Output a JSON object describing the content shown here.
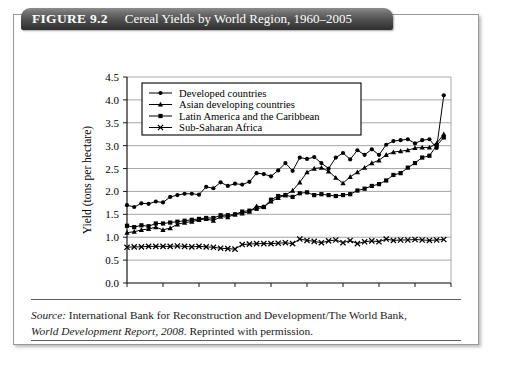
{
  "figure": {
    "label": "FIGURE 9.2",
    "title": "Cereal Yields by World Region, 1960–2005"
  },
  "source": {
    "lead": "Source:",
    "text_line1": " International Bank for Reconstruction and Development/The World Bank,",
    "italic_line2": "World Development Report, 2008",
    "text_line2_tail": ". Reprinted with permission."
  },
  "chart_data": {
    "type": "line",
    "title": "Cereal Yields by World Region, 1960–2005",
    "xlabel": "Year",
    "ylabel": "Yield (tons per hectare)",
    "xlim": [
      1960,
      2005
    ],
    "ylim": [
      0.0,
      4.5
    ],
    "ytick_step": 0.5,
    "xtick_step": 5,
    "grid": true,
    "legend_position": "top-left-inside",
    "xticks": [
      1960,
      1965,
      1970,
      1975,
      1980,
      1985,
      1990,
      1995,
      2000,
      2005
    ],
    "yticks": [
      "0.0",
      "0.5",
      "1.0",
      "1.5",
      "2.0",
      "2.5",
      "3.0",
      "3.5",
      "4.0",
      "4.5"
    ],
    "x": [
      1960,
      1961,
      1962,
      1963,
      1964,
      1965,
      1966,
      1967,
      1968,
      1969,
      1970,
      1971,
      1972,
      1973,
      1974,
      1975,
      1976,
      1977,
      1978,
      1979,
      1980,
      1981,
      1982,
      1983,
      1984,
      1985,
      1986,
      1987,
      1988,
      1989,
      1990,
      1991,
      1992,
      1993,
      1994,
      1995,
      1996,
      1997,
      1998,
      1999,
      2000,
      2001,
      2002,
      2003,
      2004
    ],
    "series": [
      {
        "name": "Developed countries",
        "marker": "circle",
        "color": "#000000",
        "values": [
          1.7,
          1.66,
          1.74,
          1.73,
          1.78,
          1.76,
          1.88,
          1.92,
          1.95,
          1.95,
          1.93,
          2.1,
          2.07,
          2.2,
          2.12,
          2.17,
          2.15,
          2.21,
          2.4,
          2.38,
          2.33,
          2.46,
          2.62,
          2.45,
          2.74,
          2.71,
          2.75,
          2.62,
          2.5,
          2.74,
          2.84,
          2.7,
          2.9,
          2.8,
          2.92,
          2.8,
          3.02,
          3.1,
          3.12,
          3.14,
          3.05,
          3.12,
          3.14,
          2.95,
          4.1
        ]
      },
      {
        "name": "Asian developing countries",
        "marker": "triangle",
        "color": "#000000",
        "values": [
          1.1,
          1.12,
          1.16,
          1.18,
          1.22,
          1.16,
          1.2,
          1.28,
          1.32,
          1.34,
          1.38,
          1.4,
          1.36,
          1.45,
          1.44,
          1.5,
          1.52,
          1.56,
          1.68,
          1.66,
          1.78,
          1.86,
          1.92,
          2.02,
          2.2,
          2.42,
          2.5,
          2.52,
          2.44,
          2.3,
          2.18,
          2.32,
          2.42,
          2.52,
          2.62,
          2.68,
          2.8,
          2.86,
          2.88,
          2.9,
          2.95,
          2.96,
          2.96,
          3.05,
          3.25
        ]
      },
      {
        "name": "Latin America and the Caribbean",
        "marker": "square",
        "color": "#000000",
        "values": [
          1.25,
          1.22,
          1.26,
          1.24,
          1.3,
          1.3,
          1.32,
          1.34,
          1.36,
          1.38,
          1.4,
          1.42,
          1.42,
          1.48,
          1.48,
          1.5,
          1.56,
          1.58,
          1.62,
          1.66,
          1.82,
          1.9,
          1.92,
          1.88,
          1.96,
          1.98,
          1.92,
          1.94,
          1.92,
          1.9,
          1.92,
          1.94,
          2.02,
          2.06,
          2.12,
          2.16,
          2.24,
          2.36,
          2.4,
          2.52,
          2.62,
          2.74,
          2.78,
          3.0,
          3.18
        ]
      },
      {
        "name": "Sub-Saharan Africa",
        "marker": "cross",
        "color": "#000000",
        "values": [
          0.78,
          0.79,
          0.79,
          0.8,
          0.8,
          0.8,
          0.8,
          0.81,
          0.8,
          0.79,
          0.8,
          0.79,
          0.78,
          0.76,
          0.75,
          0.74,
          0.84,
          0.85,
          0.86,
          0.86,
          0.86,
          0.87,
          0.88,
          0.86,
          0.96,
          0.93,
          0.91,
          0.88,
          0.92,
          0.94,
          0.88,
          0.93,
          0.86,
          0.9,
          0.92,
          0.9,
          0.96,
          0.93,
          0.94,
          0.94,
          0.95,
          0.94,
          0.93,
          0.94,
          0.95
        ]
      }
    ]
  }
}
